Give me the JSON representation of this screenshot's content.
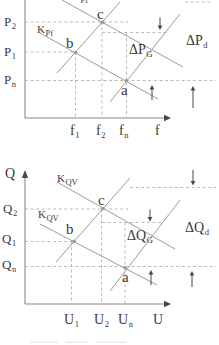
{
  "style": {
    "background": "#ffffff",
    "line_color": "#9b9b9b",
    "dash_color": "#b3b3b3",
    "axis_color": "#8a8a8a",
    "arrow_color": "#474747",
    "text_color": "#3a3a3a"
  },
  "top": {
    "kpf_upper": {
      "base": "K",
      "sub": "Pf"
    },
    "kpf_lower": {
      "base": "K",
      "sub": "Pf"
    },
    "p2": {
      "base": "P",
      "sub": "2"
    },
    "p1": {
      "base": "P",
      "sub": "1"
    },
    "pn": {
      "base": "P",
      "sub": "n"
    },
    "f1": {
      "base": "f",
      "sub": "1"
    },
    "f2": {
      "base": "f",
      "sub": "2"
    },
    "fn": {
      "base": "f",
      "sub": "n"
    },
    "f": {
      "base": "f",
      "sub": ""
    },
    "dpg": {
      "base": "ΔP",
      "sub": "G"
    },
    "dpd": {
      "base": "ΔP",
      "sub": "d"
    },
    "pt_a": "a",
    "pt_b": "b",
    "pt_c": "c"
  },
  "bottom": {
    "q": {
      "base": "Q",
      "sub": ""
    },
    "kqv_upper": {
      "base": "K",
      "sub": "QV"
    },
    "kqv_lower": {
      "base": "K",
      "sub": "QV"
    },
    "q2": {
      "base": "Q",
      "sub": "2"
    },
    "q1": {
      "base": "Q",
      "sub": "1"
    },
    "qn": {
      "base": "Q",
      "sub": "n"
    },
    "u1": {
      "base": "U",
      "sub": "1"
    },
    "u2": {
      "base": "U",
      "sub": "2"
    },
    "un": {
      "base": "U",
      "sub": "n"
    },
    "u": {
      "base": "U",
      "sub": ""
    },
    "dqg": {
      "base": "ΔQ",
      "sub": "G"
    },
    "dqd": {
      "base": "ΔQ",
      "sub": "d"
    },
    "pt_a": "a",
    "pt_b": "b",
    "pt_c": "c"
  },
  "charts": [
    {
      "id": "top",
      "type": "line",
      "x_axis_letter": "f",
      "x_ticks": [
        "f_1",
        "f_2",
        "f_n"
      ],
      "y_ticks": [
        "P_2",
        "P_1",
        "P_n"
      ],
      "curve_labels": [
        "K_Pf",
        "K_Pf"
      ],
      "annotations": [
        "ΔP_G",
        "ΔP_d"
      ],
      "points": [
        {
          "name": "a",
          "x": "f_n",
          "y": "P_n"
        },
        {
          "name": "b",
          "x": "f_1",
          "y": "P_1"
        },
        {
          "name": "c",
          "x": "f_2",
          "y": "P_2"
        }
      ]
    },
    {
      "id": "bottom",
      "type": "line",
      "x_axis_letter": "U",
      "y_axis_letter": "Q",
      "x_ticks": [
        "U_1",
        "U_2",
        "U_n"
      ],
      "y_ticks": [
        "Q_2",
        "Q_1",
        "Q_n"
      ],
      "curve_labels": [
        "K_QV",
        "K_QV"
      ],
      "annotations": [
        "ΔQ_G",
        "ΔQ_d"
      ],
      "points": [
        {
          "name": "a",
          "x": "U_n",
          "y": "Q_n"
        },
        {
          "name": "b",
          "x": "U_1",
          "y": "Q_1"
        },
        {
          "name": "c",
          "x": "U_2",
          "y": "Q_2"
        }
      ]
    }
  ]
}
